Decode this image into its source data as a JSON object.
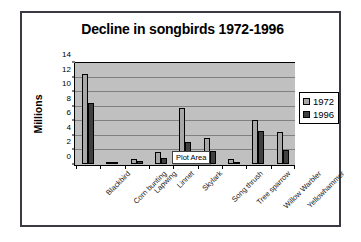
{
  "chart_data": {
    "type": "bar",
    "title": "Decline in songbirds 1972-1996",
    "xlabel": "",
    "ylabel": "Millions",
    "ylim": [
      0,
      14
    ],
    "yticks": [
      0,
      2,
      4,
      6,
      8,
      10,
      12,
      14
    ],
    "grid": true,
    "legend_position": "right",
    "categories": [
      "Blackbird",
      "Corn bunting",
      "Lapwing",
      "Linnet",
      "Skylark",
      "Song thrush",
      "Tree sparrow",
      "Willow Warbler",
      "Yellowhammer"
    ],
    "series": [
      {
        "name": "1972",
        "color": "#a8a8a8",
        "values": [
          12.5,
          0.3,
          0.7,
          1.6,
          7.8,
          3.6,
          0.7,
          6.1,
          4.4
        ]
      },
      {
        "name": "1996",
        "color": "#404040",
        "values": [
          8.5,
          0.1,
          0.35,
          0.9,
          3.1,
          1.8,
          0.15,
          4.6,
          1.9
        ]
      }
    ],
    "annotations": [
      {
        "text": "Plot Area",
        "kind": "tooltip"
      }
    ]
  },
  "colors": {
    "plot_background": "#c0c0c0",
    "gridline": "#808080",
    "axis": "#000000",
    "card_border": "#3a3a44",
    "page_background": "#ffffff"
  }
}
